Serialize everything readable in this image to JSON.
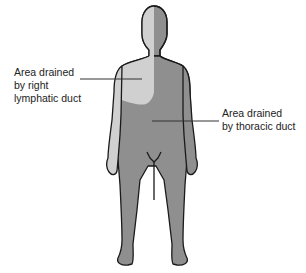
{
  "diagram": {
    "type": "anatomical-lymphatic-drainage",
    "regions": [
      {
        "name": "right-lymphatic-duct-region",
        "color": "#d0d0d0",
        "lines": [
          "Area drained",
          "by right",
          "lymphatic duct"
        ]
      },
      {
        "name": "thoracic-duct-region",
        "color": "#8f8f8f",
        "lines": [
          "Area drained",
          "by thoracic duct"
        ]
      }
    ],
    "outline_color": "#1a1a1a"
  }
}
